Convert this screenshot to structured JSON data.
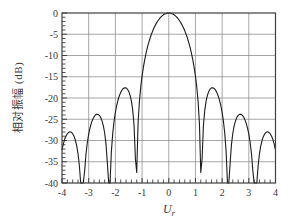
{
  "colors": {
    "background": "#ffffff",
    "grid": "#8a8a8a",
    "axis_border": "#3f3f3f",
    "tick": "#3f3f3f",
    "curve": "#1c1c1c",
    "text": "#3a3a3a"
  },
  "chart_data": {
    "type": "line",
    "title": "",
    "xlabel_base": "U",
    "xlabel_sub": "r",
    "ylabel": "相对振幅 (dB)",
    "xlim": [
      -4,
      4
    ],
    "ylim": [
      -40,
      0
    ],
    "x_ticks": [
      -4,
      -3,
      -2,
      -1,
      0,
      1,
      2,
      3,
      4
    ],
    "x_tick_labels": [
      "-4",
      "-3",
      "-2",
      "-1",
      "0",
      "1",
      "2",
      "3",
      "4"
    ],
    "y_ticks": [
      0,
      -5,
      -10,
      -15,
      -20,
      -25,
      -30,
      -35,
      -40
    ],
    "y_tick_labels": [
      "0",
      "-5",
      "-10",
      "-15",
      "-20",
      "-25",
      "-30",
      "-35",
      "-40"
    ],
    "x_minor_tick_step": 0.2,
    "y_minor_tick_step": 1,
    "grid": true,
    "legend": "none",
    "curve": {
      "name": "airy-pattern",
      "formula": "y_dB = 20*log10(abs(2*J1(pi*x)/(pi*x)))",
      "sample_step": 0.05,
      "clip_db": -40,
      "key_points": {
        "peak": {
          "x": 0,
          "y_db": 0
        },
        "nulls_x": [
          -3.238,
          -2.233,
          -1.22,
          1.22,
          2.233,
          3.238
        ],
        "null_dip_at_1_22_db": -37.5,
        "sidelobe_peaks": [
          {
            "x": -3.7,
            "y_db": -27.96
          },
          {
            "x": -2.68,
            "y_db": -23.81
          },
          {
            "x": -1.635,
            "y_db": -17.57
          },
          {
            "x": 1.635,
            "y_db": -17.57
          },
          {
            "x": 2.68,
            "y_db": -23.81
          },
          {
            "x": 3.7,
            "y_db": -27.96
          }
        ],
        "edge_values": [
          {
            "x": -4,
            "y_db": -31.9
          },
          {
            "x": 4,
            "y_db": -31.9
          }
        ]
      }
    },
    "plot_box": {
      "left": 62,
      "top": 13,
      "right": 275.5,
      "bottom": 183
    }
  }
}
